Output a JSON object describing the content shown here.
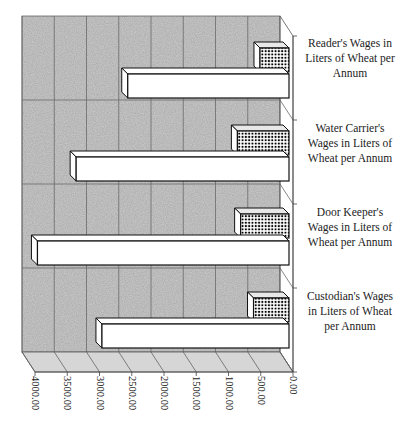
{
  "chart_data": {
    "type": "bar",
    "orientation": "horizontal",
    "style": "3d-clustered",
    "title": "",
    "xlabel": "",
    "ylabel": "",
    "categories": [
      "Reader's Wages in Liters of Wheat per Annum",
      "Water Carrier's Wages in Liters of Wheat per Annum",
      "Door Keeper's Wages in Liters of Wheat per Annum",
      "Custodian's Wages in Liters of Wheat per Annum"
    ],
    "series": [
      {
        "name": "Series 1 (white, front)",
        "values": [
          2500,
          3300,
          3900,
          2900
        ]
      },
      {
        "name": "Series 2 (checkered, back)",
        "values": [
          450,
          800,
          750,
          550
        ]
      }
    ],
    "axis": {
      "reversed": true,
      "range": [
        0,
        4000
      ],
      "ticks": [
        "0.00",
        "500.00",
        "1000.00",
        "1500.00",
        "2000.00",
        "2500.00",
        "3000.00",
        "3500.00",
        "4000.00"
      ],
      "tick_values": [
        0,
        500,
        1000,
        1500,
        2000,
        2500,
        3000,
        3500,
        4000
      ]
    },
    "grid": true,
    "legend": "none",
    "colors": {
      "wall": "#cdcdcd",
      "grid": "#6a6a6a",
      "bar_front": "#ffffff",
      "bar_outline": "#111111",
      "checker_dot": "#000000"
    }
  },
  "labels": {
    "cat0": [
      "Reader's Wages in",
      "Liters of Wheat per",
      "Annum"
    ],
    "cat1": [
      "Water Carrier's",
      "Wages in Liters of",
      "Wheat per Annum"
    ],
    "cat2": [
      "Door Keeper's",
      "Wages in Liters of",
      "Wheat per Annum"
    ],
    "cat3": [
      "Custodian's Wages",
      "in Liters of Wheat",
      "per Annum"
    ]
  }
}
